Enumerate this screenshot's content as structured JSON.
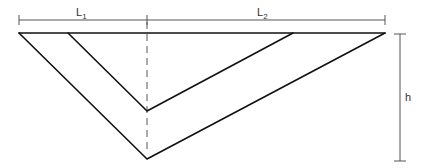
{
  "diagram": {
    "type": "geometric-dimension-drawing",
    "labels": {
      "L1": {
        "main": "L",
        "sub": "1"
      },
      "L2": {
        "main": "L",
        "sub": "2"
      },
      "h": "h"
    },
    "colors": {
      "edge": "#111111",
      "dimension": "#555555",
      "background": "#ffffff"
    }
  }
}
